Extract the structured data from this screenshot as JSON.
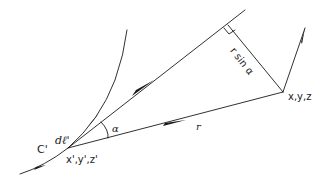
{
  "labels": {
    "curve": "C'",
    "element": "dℓ'",
    "source_point": "x',y',z'",
    "field_point": "x,y,z",
    "angle": "α",
    "vector": "r",
    "distance": "r sin α"
  },
  "colors": {
    "ink": "#1a1a1a",
    "background": "#ffffff"
  }
}
